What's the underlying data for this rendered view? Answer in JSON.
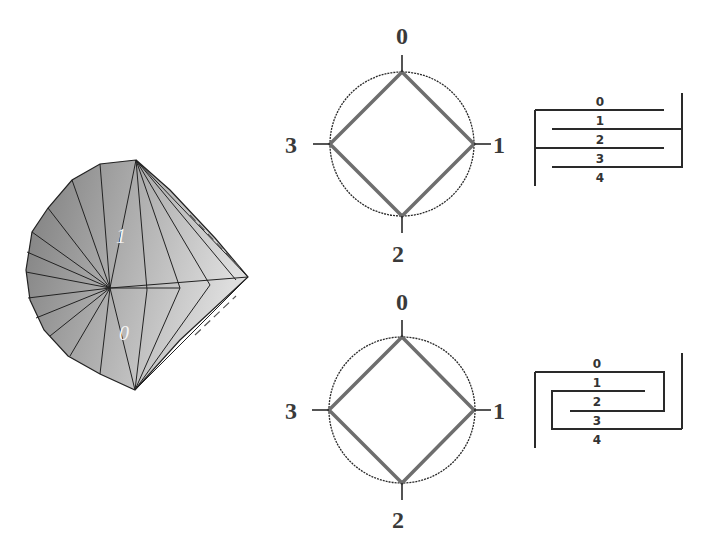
{
  "cone": {
    "edge_labels": [
      "1",
      "0"
    ],
    "fill_dark": "#7c7c7c",
    "fill_light": "#d8d8d8",
    "line_color": "#222222"
  },
  "diagrams": [
    {
      "id": "top",
      "circle_labels": {
        "top": "0",
        "right": "1",
        "bottom": "2",
        "left": "3"
      },
      "strip_labels": [
        "0",
        "1",
        "2",
        "3",
        "4"
      ]
    },
    {
      "id": "bottom",
      "circle_labels": {
        "top": "0",
        "right": "1",
        "bottom": "2",
        "left": "3"
      },
      "strip_labels": [
        "0",
        "1",
        "2",
        "3",
        "4"
      ]
    }
  ],
  "colors": {
    "square": "#6e6e6e",
    "circle": "#2a2a2a",
    "text": "#3a3a3a"
  }
}
